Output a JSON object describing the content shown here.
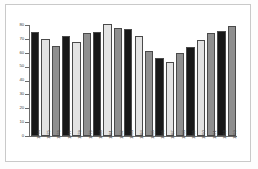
{
  "chart_data": {
    "type": "bar",
    "title": "",
    "subtitle": "",
    "xlabel": "",
    "ylabel": "",
    "categories": [
      "1974",
      "1975",
      "1976",
      "1977",
      "1978",
      "1979",
      "1980",
      "1981",
      "1982",
      "1983",
      "1984",
      "1985",
      "1986",
      "1987",
      "1988",
      "1989",
      "1990",
      "1991",
      "1992",
      "1993"
    ],
    "values": [
      75,
      70,
      65,
      72,
      68,
      74,
      75,
      81,
      78,
      77,
      72,
      61,
      56,
      53,
      60,
      64,
      69,
      74,
      76,
      79
    ],
    "ylim": [
      0,
      80
    ],
    "yticks": [
      0,
      10,
      20,
      30,
      40,
      50,
      60,
      70,
      80
    ],
    "ytick_labels": [
      "0",
      "10",
      "20",
      "30",
      "40",
      "50",
      "60",
      "70",
      "80"
    ],
    "grid": false,
    "legend": "none",
    "series": [
      {
        "name": "value",
        "values": [
          75,
          70,
          65,
          72,
          68,
          74,
          75,
          81,
          78,
          77,
          72,
          61,
          56,
          53,
          60,
          64,
          69,
          74,
          76,
          79
        ]
      }
    ],
    "bar_colors": [
      "#181818",
      "#e3e3e3",
      "#8f8f8f",
      "#181818",
      "#e3e3e3",
      "#8f8f8f",
      "#181818",
      "#e3e3e3",
      "#8f8f8f",
      "#181818",
      "#e3e3e3",
      "#8f8f8f",
      "#181818",
      "#e3e3e3",
      "#8f8f8f",
      "#181818",
      "#e3e3e3",
      "#8f8f8f",
      "#181818",
      "#8f8f8f"
    ],
    "palette": {
      "dark": "#181818",
      "light": "#e3e3e3",
      "medium": "#8f8f8f",
      "axis": "#6b6b6b",
      "border": "#c9c9c9",
      "background": "#ffffff"
    }
  }
}
